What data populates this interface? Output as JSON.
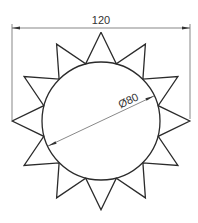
{
  "drawing": {
    "title": "Sun-shaped star with circle",
    "units_to_px": 1.48,
    "center": {
      "x": 101,
      "y": 121
    },
    "circle": {
      "diameter": 80,
      "label": "Ø80"
    },
    "star": {
      "points": 12,
      "outer_diameter": 120,
      "start_angle_deg": 90
    },
    "dimensions": [
      {
        "type": "linear-horizontal",
        "value": 120,
        "label": "120"
      },
      {
        "type": "diameter",
        "value": 80,
        "label": "Ø80"
      }
    ],
    "colors": {
      "outline": "#2b2b2b",
      "dimension": "#555555",
      "background": "#ffffff"
    }
  }
}
